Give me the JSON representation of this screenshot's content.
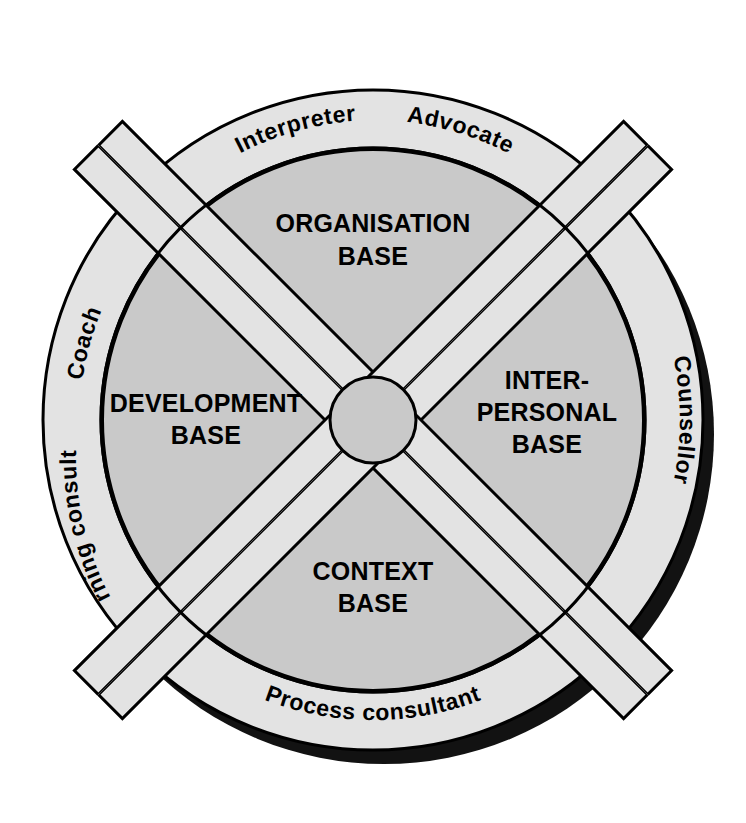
{
  "diagram": {
    "center": {
      "x": 373,
      "y": 420
    },
    "geometry": {
      "outer_radius": 330,
      "inner_radius": 272,
      "hub_radius": 43,
      "divider_half_width": 17,
      "shadow_offset_x": 10,
      "shadow_offset_y": 13
    },
    "colors": {
      "page_background": "#ffffff",
      "outer_ring_fill": "#e3e3e3",
      "segment_fill": "#c9c9c9",
      "divider_fill": "#e3e3e3",
      "hub_fill": "#c9c9c9",
      "stroke": "#000000",
      "shadow": "#121212",
      "text": "#000000"
    },
    "outer_ring_labels": [
      {
        "id": "interpreter",
        "text": "Interpreter",
        "position": "top-left-of-top",
        "start_angle": -118,
        "sweep": 34
      },
      {
        "id": "advocate",
        "text": "Advocate",
        "position": "top-right-of-top",
        "start_angle": -76,
        "sweep": 28
      },
      {
        "id": "counsellor",
        "text": "Counsellor",
        "position": "right",
        "start_angle": -22,
        "sweep": 44
      },
      {
        "id": "process-consultant",
        "text": "Process consultant",
        "position": "bottom",
        "start_angle": 70,
        "sweep": 52
      },
      {
        "id": "learning-consultant",
        "text": "Learning consultant",
        "position": "lower-left",
        "start_angle": 142,
        "sweep": 50
      },
      {
        "id": "coach",
        "text": "Coach",
        "position": "upper-left",
        "start_angle": 200,
        "sweep": 22
      }
    ],
    "segments": [
      {
        "id": "organisation-base",
        "position": "top",
        "name": "ORGANISATION BASE",
        "lines": [
          "ORGANISATION",
          "BASE"
        ],
        "label_x": 373,
        "label_y": 232
      },
      {
        "id": "interpersonal-base",
        "position": "right",
        "name": "INTER-PERSONAL BASE",
        "lines": [
          "INTER-",
          "PERSONAL",
          "BASE"
        ],
        "label_x": 546,
        "label_y": 389
      },
      {
        "id": "context-base",
        "position": "bottom",
        "name": "CONTEXT BASE",
        "lines": [
          "CONTEXT",
          "BASE"
        ],
        "label_x": 373,
        "label_y": 580
      },
      {
        "id": "development-base",
        "position": "left",
        "name": "DEVELOPMENT BASE",
        "lines": [
          "DEVELOPMENT",
          "BASE"
        ],
        "label_x": 206,
        "label_y": 412
      }
    ],
    "hub": {
      "id": "centre-hub",
      "label": ""
    }
  }
}
